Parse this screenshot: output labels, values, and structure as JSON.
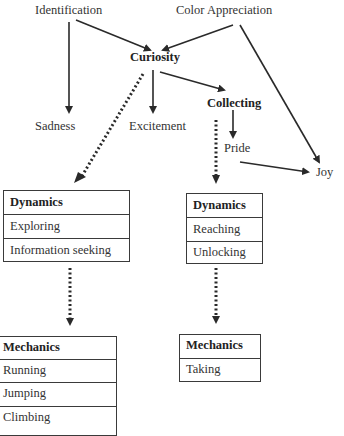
{
  "nodes": {
    "identification": "Identification",
    "color_appreciation": "Color Appreciation",
    "curiosity": "Curiosity",
    "sadness": "Sadness",
    "excitement": "Excitement",
    "collecting": "Collecting",
    "pride": "Pride",
    "joy": "Joy"
  },
  "boxes": {
    "left_dynamics": {
      "title": "Dynamics",
      "items": [
        "Exploring",
        "Information seeking"
      ]
    },
    "right_dynamics": {
      "title": "Dynamics",
      "items": [
        "Reaching",
        "Unlocking"
      ]
    },
    "left_mechanics": {
      "title": "Mechanics",
      "items": [
        "Running",
        "Jumping",
        "Climbing"
      ]
    },
    "right_mechanics": {
      "title": "Mechanics",
      "items": [
        "Taking"
      ]
    }
  },
  "edges": [
    {
      "from": "Identification",
      "to": "Sadness",
      "style": "solid"
    },
    {
      "from": "Identification",
      "to": "Curiosity",
      "style": "solid"
    },
    {
      "from": "Color Appreciation",
      "to": "Curiosity",
      "style": "solid"
    },
    {
      "from": "Color Appreciation",
      "to": "Joy",
      "style": "solid"
    },
    {
      "from": "Curiosity",
      "to": "Excitement",
      "style": "solid"
    },
    {
      "from": "Curiosity",
      "to": "Collecting",
      "style": "solid"
    },
    {
      "from": "Curiosity",
      "to": "Dynamics (Exploring, Information seeking)",
      "style": "dotted"
    },
    {
      "from": "Collecting",
      "to": "Pride",
      "style": "solid"
    },
    {
      "from": "Collecting",
      "to": "Dynamics (Reaching, Unlocking)",
      "style": "dotted"
    },
    {
      "from": "Pride",
      "to": "Joy",
      "style": "solid"
    },
    {
      "from": "Dynamics (Exploring, Information seeking)",
      "to": "Mechanics (Running, Jumping, Climbing)",
      "style": "dotted"
    },
    {
      "from": "Dynamics (Reaching, Unlocking)",
      "to": "Mechanics (Taking)",
      "style": "dotted"
    }
  ]
}
